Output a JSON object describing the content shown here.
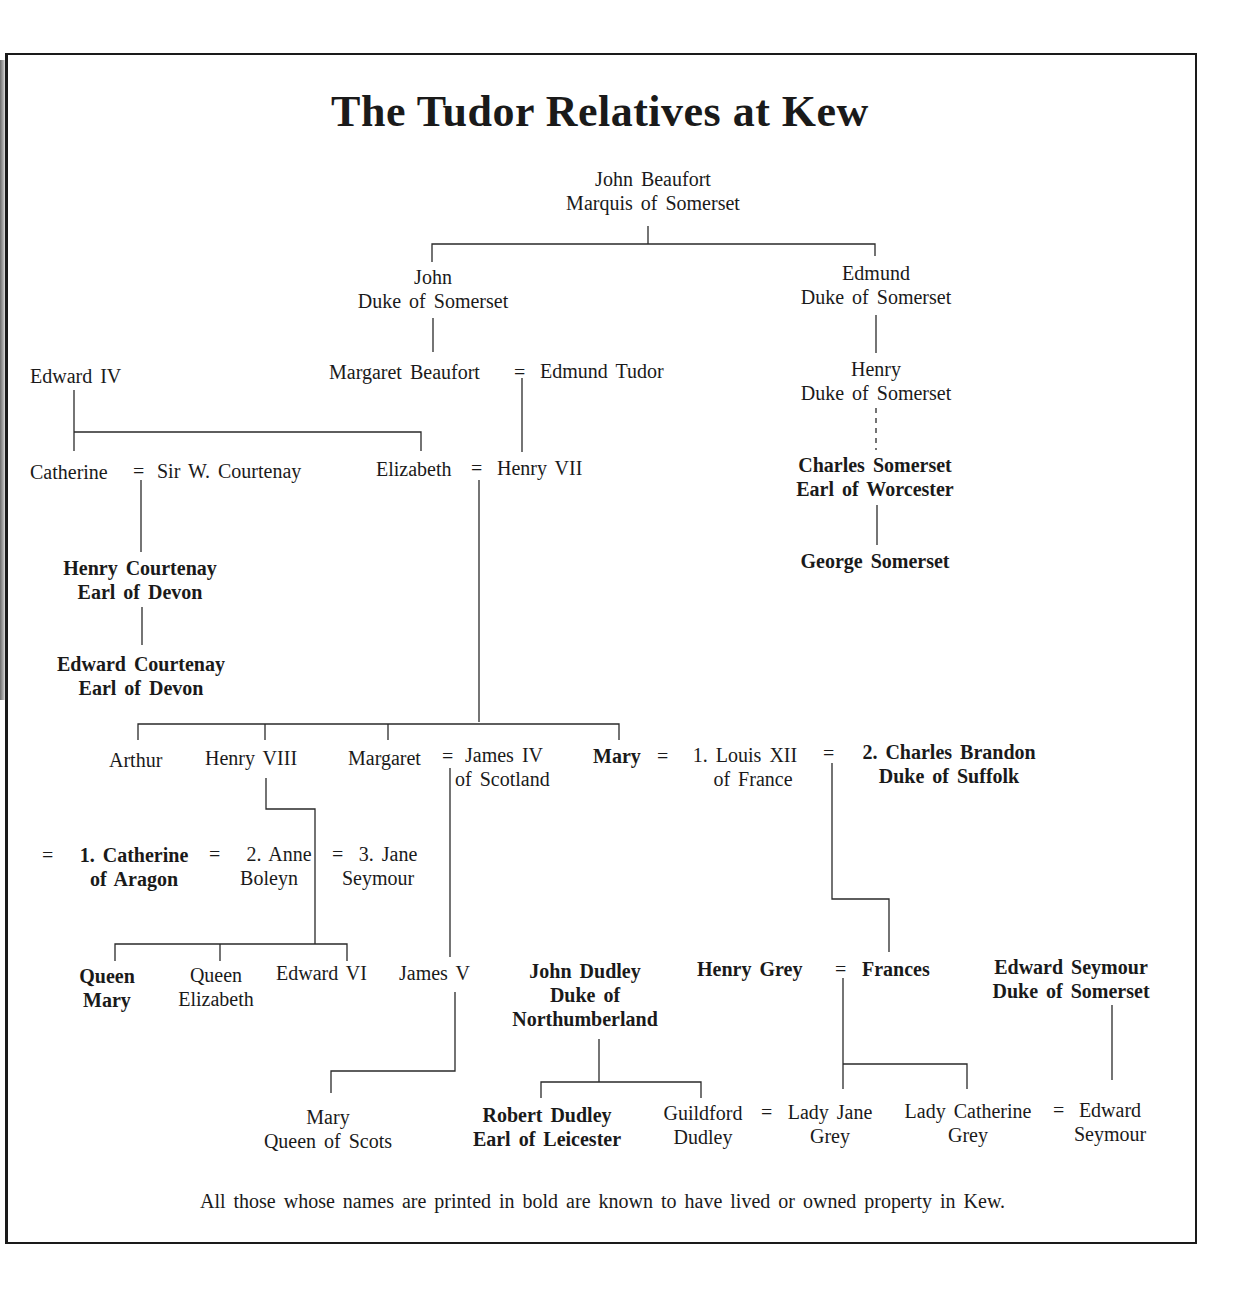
{
  "title": "The Tudor Relatives at Kew",
  "footnote": "All those whose names are printed in bold are known to have lived or owned property in Kew.",
  "nodes": {
    "john_beaufort": {
      "line1": "John Beaufort",
      "line2": "Marquis of Somerset",
      "bold": false
    },
    "john_duke": {
      "line1": "John",
      "line2": "Duke of Somerset",
      "bold": false
    },
    "edmund_duke": {
      "line1": "Edmund",
      "line2": "Duke of Somerset",
      "bold": false
    },
    "edward_iv": {
      "line1": "Edward IV",
      "bold": false
    },
    "margaret_beaufort": {
      "line1": "Margaret Beaufort",
      "bold": false
    },
    "edmund_tudor": {
      "line1": "Edmund Tudor",
      "bold": false
    },
    "henry_duke": {
      "line1": "Henry",
      "line2": "Duke of Somerset",
      "bold": false
    },
    "catherine": {
      "line1": "Catherine",
      "bold": false
    },
    "sir_w_courtenay": {
      "line1": "Sir W. Courtenay",
      "bold": false
    },
    "elizabeth": {
      "line1": "Elizabeth",
      "bold": false
    },
    "henry_vii": {
      "line1": "Henry VII",
      "bold": false
    },
    "charles_somerset": {
      "line1": "Charles Somerset",
      "line2": "Earl of Worcester",
      "bold": true
    },
    "george_somerset": {
      "line1": "George Somerset",
      "bold": true
    },
    "henry_courtenay": {
      "line1": "Henry Courtenay",
      "line2": "Earl of Devon",
      "bold": true
    },
    "edward_courtenay": {
      "line1": "Edward Courtenay",
      "line2": "Earl of Devon",
      "bold": true
    },
    "arthur": {
      "line1": "Arthur",
      "bold": false
    },
    "henry_viii": {
      "line1": "Henry VIII",
      "bold": false
    },
    "margaret": {
      "line1": "Margaret",
      "bold": false
    },
    "james_iv": {
      "line1": "James IV",
      "line2": "of Scotland",
      "bold": false
    },
    "mary": {
      "line1": "Mary",
      "bold": true
    },
    "louis_xii": {
      "line1": "1. Louis XII",
      "line2": "of France",
      "bold": false
    },
    "charles_brandon": {
      "line1": "2. Charles Brandon",
      "line2": "Duke of Suffolk",
      "bold": true
    },
    "catherine_of_aragon": {
      "line1": "1. Catherine",
      "line2": "of Aragon",
      "bold": true
    },
    "anne_boleyn": {
      "line1": "2. Anne",
      "line2": "Boleyn",
      "bold": false
    },
    "jane_seymour": {
      "line1": "3. Jane",
      "line2": "Seymour",
      "bold": false
    },
    "queen_mary": {
      "line1": "Queen",
      "line2": "Mary",
      "bold": true
    },
    "queen_elizabeth": {
      "line1": "Queen",
      "line2": "Elizabeth",
      "bold": false
    },
    "edward_vi": {
      "line1": "Edward VI",
      "bold": false
    },
    "james_v": {
      "line1": "James V",
      "bold": false
    },
    "john_dudley": {
      "line1": "John Dudley",
      "line2": "Duke of",
      "line3": "Northumberland",
      "bold": true
    },
    "henry_grey": {
      "line1": "Henry Grey",
      "bold": true
    },
    "frances": {
      "line1": "Frances",
      "bold": true
    },
    "edward_seymour_duke": {
      "line1": "Edward Seymour",
      "line2": "Duke of Somerset",
      "bold": true
    },
    "mary_queen_of_scots": {
      "line1": "Mary",
      "line2": "Queen of Scots",
      "bold": false
    },
    "robert_dudley": {
      "line1": "Robert Dudley",
      "line2": "Earl of Leicester",
      "bold": true
    },
    "guildford_dudley": {
      "line1": "Guildford",
      "line2": "Dudley",
      "bold": false
    },
    "lady_jane_grey": {
      "line1": "Lady Jane",
      "line2": "Grey",
      "bold": false
    },
    "lady_catherine_grey": {
      "line1": "Lady Catherine",
      "line2": "Grey",
      "bold": false
    },
    "edward_seymour": {
      "line1": "Edward",
      "line2": "Seymour",
      "bold": false
    }
  },
  "symbols": {
    "marriage": "="
  },
  "marriages": [
    [
      "margaret_beaufort",
      "edmund_tudor"
    ],
    [
      "catherine",
      "sir_w_courtenay"
    ],
    [
      "elizabeth",
      "henry_vii"
    ],
    [
      "margaret",
      "james_iv"
    ],
    [
      "mary",
      "louis_xii"
    ],
    [
      "mary",
      "charles_brandon"
    ],
    [
      "henry_viii",
      "catherine_of_aragon"
    ],
    [
      "henry_viii",
      "anne_boleyn"
    ],
    [
      "henry_viii",
      "jane_seymour"
    ],
    [
      "henry_grey",
      "frances"
    ],
    [
      "guildford_dudley",
      "lady_jane_grey"
    ],
    [
      "lady_catherine_grey",
      "edward_seymour"
    ]
  ]
}
